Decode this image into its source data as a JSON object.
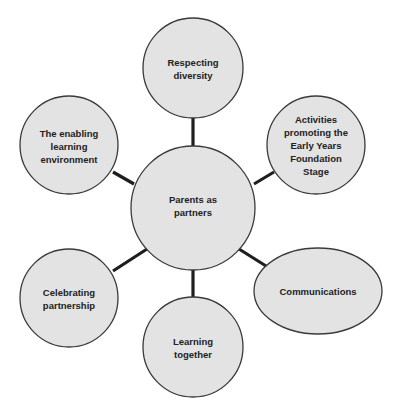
{
  "diagram": {
    "type": "spider-diagram",
    "center": {
      "label_lines": [
        "Parents as",
        "partners"
      ]
    },
    "nodes": [
      {
        "id": "respecting-diversity",
        "label_lines": [
          "Respecting",
          "diversity"
        ]
      },
      {
        "id": "activities-eyfs",
        "label_lines": [
          "Activities",
          "promoting the",
          "Early Years",
          "Foundation",
          "Stage"
        ]
      },
      {
        "id": "communications",
        "label_lines": [
          "Communications"
        ]
      },
      {
        "id": "learning-together",
        "label_lines": [
          "Learning",
          "together"
        ]
      },
      {
        "id": "celebrating-partnership",
        "label_lines": [
          "Celebrating",
          "partnership"
        ]
      },
      {
        "id": "enabling-environment",
        "label_lines": [
          "The enabling",
          "learning",
          "environment"
        ]
      }
    ],
    "colors": {
      "node_fill": "#e3e3e3",
      "node_stroke": "#3a3a3a",
      "connector": "#1e1e1e",
      "text": "#222222"
    }
  }
}
